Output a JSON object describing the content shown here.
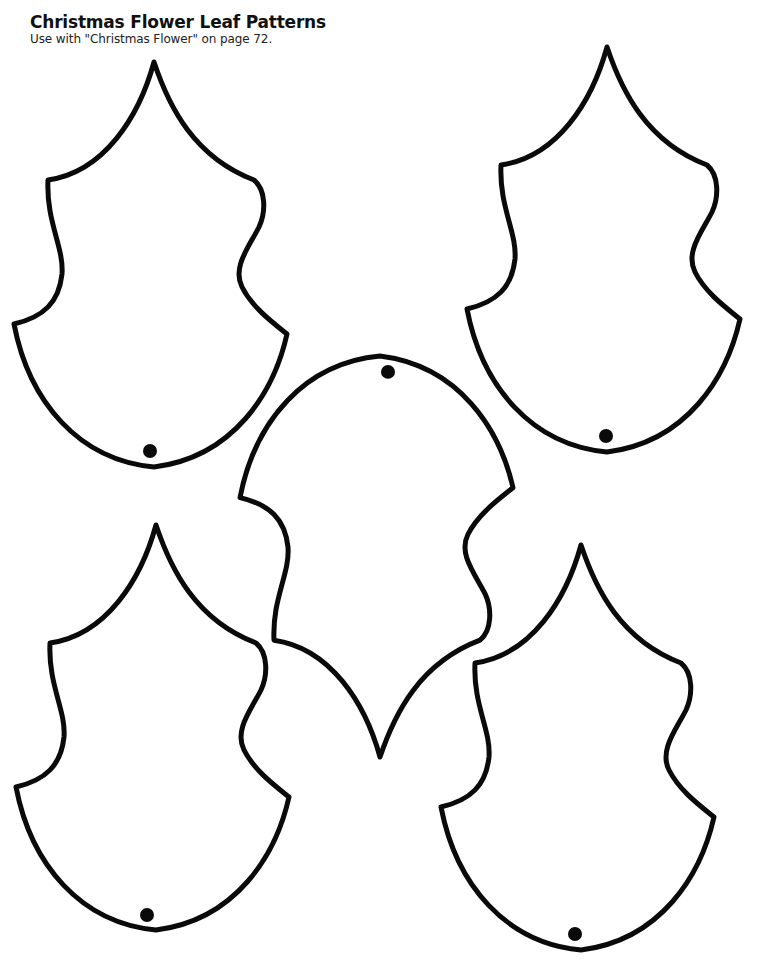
{
  "header": {
    "title": "Christmas Flower Leaf Patterns",
    "subtitle": "Use with \"Christmas Flower\" on page 72."
  },
  "leaves": [
    {
      "name": "leaf-top-left",
      "orientation": "tip-up",
      "has_hole": true
    },
    {
      "name": "leaf-top-right",
      "orientation": "tip-up",
      "has_hole": true
    },
    {
      "name": "leaf-center",
      "orientation": "tip-down",
      "has_hole": true
    },
    {
      "name": "leaf-bottom-left",
      "orientation": "tip-up",
      "has_hole": true
    },
    {
      "name": "leaf-bottom-right",
      "orientation": "tip-up",
      "has_hole": true
    }
  ],
  "colors": {
    "outline": "#0a0a0a",
    "background": "#ffffff"
  }
}
